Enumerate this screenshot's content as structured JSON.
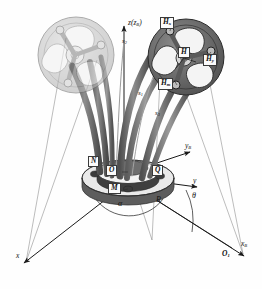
{
  "figure": {
    "type": "engineering-mechanism-diagram",
    "title_text": "",
    "colors": {
      "dark_body": "#4a4a4a",
      "mid_body": "#6e6e6e",
      "light_body": "#b9b9b9",
      "ghost_body": "#c9c9c9",
      "stroke": "#2b2b2b",
      "axis": "#1a1a1a",
      "background": "#fefefe",
      "label_box_fill": "#fbfbfb"
    }
  },
  "axes": {
    "vertical": {
      "label": "z",
      "sublabel": "(z",
      "sub_sub": "B",
      "close": ")",
      "full": "z(zB)"
    },
    "y_body": {
      "label": "y",
      "sub": "B"
    },
    "y_fixed": {
      "label": "y",
      "sub": ""
    },
    "x_fixed": {
      "label": "x",
      "sub": ""
    },
    "x_body": {
      "label": "x",
      "sub": "B"
    }
  },
  "points": [
    {
      "id": "N",
      "label": "N",
      "sub": ""
    },
    {
      "id": "O",
      "label": "O",
      "sub": ""
    },
    {
      "id": "Q",
      "label": "Q",
      "sub": ""
    },
    {
      "id": "M",
      "label": "M",
      "sub": ""
    },
    {
      "id": "O1",
      "label": "O",
      "sub": "1"
    },
    {
      "id": "H",
      "label": "H",
      "sub": ""
    },
    {
      "id": "Hx",
      "label": "H",
      "sub": "x"
    },
    {
      "id": "Hy",
      "label": "H",
      "sub": "y"
    },
    {
      "id": "Hm",
      "label": "H",
      "sub": "m"
    }
  ],
  "legs": [
    {
      "id": "s1",
      "label": "s",
      "sub": "1"
    },
    {
      "id": "s2",
      "label": "s",
      "sub": "2"
    },
    {
      "id": "s3",
      "label": "s",
      "sub": "3"
    }
  ],
  "dimensions": [
    {
      "id": "R",
      "label": "R",
      "sub": ""
    },
    {
      "id": "theta",
      "label": "θ",
      "sub": ""
    },
    {
      "id": "alpha",
      "label": "α",
      "sub": ""
    }
  ]
}
